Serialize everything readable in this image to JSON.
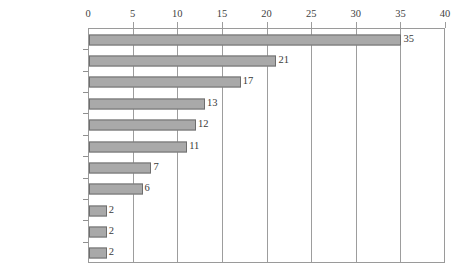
{
  "chart_data": {
    "type": "bar",
    "orientation": "horizontal",
    "title": "",
    "subtitle": "",
    "xlabel": "",
    "ylabel": "",
    "xlim": [
      0,
      40
    ],
    "xticks": [
      0,
      5,
      10,
      15,
      20,
      25,
      30,
      35,
      40
    ],
    "xtick_labels": [
      "0",
      "5",
      "10",
      "15",
      "20",
      "25",
      "30",
      "35",
      "40"
    ],
    "grid": true,
    "grid_axis": "x",
    "axis_position": "top",
    "legend": null,
    "data_labels": true,
    "categories": [
      "工作增加",
      "改变数量",
      "工作减少",
      "改变结构",
      "改变材料",
      "改变施工方法",
      "改变品牌",
      "改变尺寸",
      "改变位置",
      "改变质量标准",
      "返工"
    ],
    "values": [
      35,
      21,
      17,
      13,
      12,
      11,
      7,
      6,
      2,
      2,
      2
    ],
    "value_labels": [
      "35",
      "21",
      "17",
      "13",
      "12",
      "11",
      "7",
      "6",
      "2",
      "2",
      "2"
    ],
    "colors": {
      "bar_fill": "#a9a9a9",
      "bar_border": "#6e6e6e",
      "gridline": "#9d9d9d",
      "plot_border": "#9a9a9a",
      "background": "#ffffff",
      "text": "#3a3a3a"
    }
  }
}
